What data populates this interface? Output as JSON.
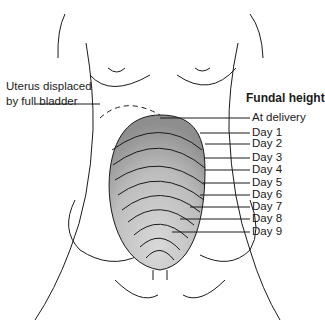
{
  "diagram": {
    "title": "Fundal height",
    "left_label_line1": "Uterus displaced",
    "left_label_line2": "by full bladder",
    "labels": [
      "At delivery",
      "Day 1",
      "Day 2",
      "Day 3",
      "Day 4",
      "Day 5",
      "Day 6",
      "Day 7",
      "Day 8",
      "Day 9"
    ],
    "colors": {
      "line": "#1a1a1a",
      "fill_dark": "#8a8a8a",
      "fill_mid": "#b5b5b5",
      "fill_light": "#dcdcdc"
    }
  }
}
